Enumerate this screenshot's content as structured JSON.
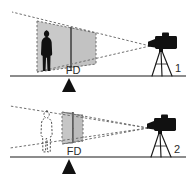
{
  "figure": {
    "background_color": "#ffffff",
    "line_color": "#1a1a1a",
    "dash_color": "#6e6e6e",
    "fill_gray": "#c9c9c9",
    "fill_gray_dark": "#b4b4b4",
    "silhouette_color": "#111111",
    "width": 192,
    "height": 187
  },
  "panels": [
    {
      "id": "panel-1",
      "number_label": "1",
      "fd_label": "FD",
      "description": "Wide field of view, subject close to camera, large focal-distance plane",
      "subject_style": "filled-silhouette",
      "cone_width": "wide",
      "plane_size": "large",
      "ground_marker": "triangle"
    },
    {
      "id": "panel-2",
      "number_label": "2",
      "fd_label": "FD",
      "description": "Narrow field of view, subject further from camera, small focal-distance plane",
      "subject_style": "outline-dashed",
      "cone_width": "narrow",
      "plane_size": "small",
      "ground_marker": "triangle"
    }
  ]
}
